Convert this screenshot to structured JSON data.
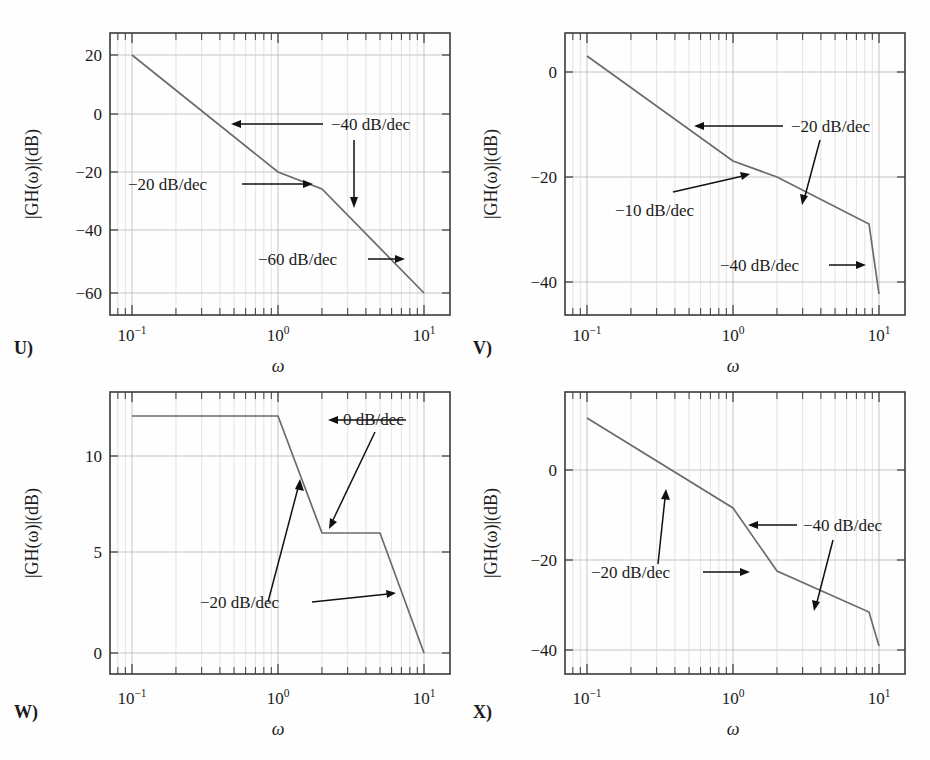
{
  "figure": {
    "curve_color": "#6b6b6b",
    "grid_color": "#b9b9b9",
    "axis_color": "#3a3a3a",
    "text_color": "#1b1b1b"
  },
  "common": {
    "xlabel": "ω",
    "ylabel": "|GH(ω)|(dB)",
    "xticks": [
      "10⁻¹",
      "10⁰",
      "10¹"
    ],
    "xtick_base": "10",
    "xtick_exponents": [
      "−1",
      "0",
      "1"
    ],
    "xtick_values": [
      0.1,
      1,
      10
    ],
    "xlim": [
      0.07,
      13
    ]
  },
  "chart_data": [
    {
      "id": "U",
      "panel_label": "U)",
      "type": "line",
      "title": "",
      "xlabel": "ω",
      "ylabel": "|GH(ω)|(dB)",
      "xscale": "log",
      "xlim": [
        0.07,
        13
      ],
      "ylim": [
        -68,
        28
      ],
      "yticks": [
        20,
        0,
        -20,
        -40,
        -60
      ],
      "ytick_labels": [
        "20",
        "0",
        "−20",
        "−40",
        "−60"
      ],
      "grid": true,
      "legend": "none",
      "points": [
        {
          "x": 0.1,
          "y": 20
        },
        {
          "x": 1.0,
          "y": -20
        },
        {
          "x": 2.0,
          "y": -26
        },
        {
          "x": 5.0,
          "y": -42
        },
        {
          "x": 10.0,
          "y": -60
        }
      ],
      "segments": [
        {
          "from_x": 0.1,
          "to_x": 1.0,
          "slope_db_per_dec": -40
        },
        {
          "from_x": 1.0,
          "to_x": 2.0,
          "slope_db_per_dec": -20
        },
        {
          "from_x": 2.0,
          "to_x": 10.0,
          "slope_db_per_dec": -60
        }
      ],
      "annotations": [
        {
          "label": "−40 dB/dec",
          "kind": "horizontal-left-arrow"
        },
        {
          "label": "−20 dB/dec",
          "kind": "horizontal-right-arrow"
        },
        {
          "label": "−60 dB/dec",
          "kind": "horizontal-right-arrow"
        },
        {
          "label": "−40 dB/dec-downarrow",
          "kind": "vertical-down-arrow"
        }
      ]
    },
    {
      "id": "V",
      "panel_label": "V)",
      "type": "line",
      "title": "",
      "xlabel": "ω",
      "ylabel": "|GH(ω)|(dB)",
      "xscale": "log",
      "xlim": [
        0.07,
        13
      ],
      "ylim": [
        -46,
        8
      ],
      "yticks": [
        0,
        -20,
        -40
      ],
      "ytick_labels": [
        "0",
        "−20",
        "−40"
      ],
      "grid": true,
      "legend": "none",
      "points": [
        {
          "x": 0.1,
          "y": 4
        },
        {
          "x": 1.0,
          "y": -16
        },
        {
          "x": 2.0,
          "y": -19
        },
        {
          "x": 5.0,
          "y": -28
        },
        {
          "x": 10.0,
          "y": -40
        }
      ],
      "segments": [
        {
          "from_x": 0.1,
          "to_x": 1.0,
          "slope_db_per_dec": -20
        },
        {
          "from_x": 1.0,
          "to_x": 2.0,
          "slope_db_per_dec": -10
        },
        {
          "from_x": 2.0,
          "to_x": 5.0,
          "slope_db_per_dec": -20
        },
        {
          "from_x": 5.0,
          "to_x": 10.0,
          "slope_db_per_dec": -40
        }
      ],
      "annotations": [
        {
          "label": "−20 dB/dec",
          "kind": "horizontal-left-arrow"
        },
        {
          "label": "−10 dB/dec",
          "kind": "diagonal-up-right-arrow"
        },
        {
          "label": "−40 dB/dec",
          "kind": "horizontal-right-arrow"
        }
      ]
    },
    {
      "id": "W",
      "panel_label": "W)",
      "type": "line",
      "title": "",
      "xlabel": "ω",
      "ylabel": "|GH(ω)|(dB)",
      "xscale": "log",
      "xlim": [
        0.07,
        13
      ],
      "ylim": [
        -1.6,
        13.2
      ],
      "yticks": [
        10,
        5,
        0
      ],
      "ytick_labels": [
        "10",
        "5",
        "0"
      ],
      "grid": true,
      "legend": "none",
      "points": [
        {
          "x": 0.1,
          "y": 12
        },
        {
          "x": 1.0,
          "y": 12
        },
        {
          "x": 2.0,
          "y": 6
        },
        {
          "x": 5.0,
          "y": 6
        },
        {
          "x": 10.0,
          "y": 0
        }
      ],
      "segments": [
        {
          "from_x": 0.1,
          "to_x": 1.0,
          "slope_db_per_dec": 0
        },
        {
          "from_x": 1.0,
          "to_x": 2.0,
          "slope_db_per_dec": -20
        },
        {
          "from_x": 2.0,
          "to_x": 5.0,
          "slope_db_per_dec": 0
        },
        {
          "from_x": 5.0,
          "to_x": 10.0,
          "slope_db_per_dec": -20
        }
      ],
      "annotations": [
        {
          "label": "0 dB/dec",
          "kind": "horizontal-left-arrow"
        },
        {
          "label": "0 dB/dec-diagonal",
          "kind": "diagonal-down-left-arrow"
        },
        {
          "label": "−20 dB/dec",
          "kind": "diagonal-up-right-arrow"
        },
        {
          "label": "−20 dB/dec-right",
          "kind": "horizontal-right-arrow"
        }
      ]
    },
    {
      "id": "X",
      "panel_label": "X)",
      "type": "line",
      "title": "",
      "xlabel": "ω",
      "ylabel": "|GH(ω)|(dB)",
      "xscale": "log",
      "xlim": [
        0.07,
        13
      ],
      "ylim": [
        -46,
        10
      ],
      "yticks": [
        0,
        -20,
        -40
      ],
      "ytick_labels": [
        "0",
        "−20",
        "−40"
      ],
      "grid": true,
      "legend": "none",
      "points": [
        {
          "x": 0.1,
          "y": 8
        },
        {
          "x": 1.0,
          "y": -8
        },
        {
          "x": 2.0,
          "y": -20
        },
        {
          "x": 5.0,
          "y": -28
        },
        {
          "x": 10.0,
          "y": -40
        }
      ],
      "segments": [
        {
          "from_x": 0.1,
          "to_x": 1.0,
          "slope_db_per_dec": -16
        },
        {
          "from_x": 1.0,
          "to_x": 2.0,
          "slope_db_per_dec": -40
        },
        {
          "from_x": 2.0,
          "to_x": 5.0,
          "slope_db_per_dec": -20
        },
        {
          "from_x": 5.0,
          "to_x": 10.0,
          "slope_db_per_dec": -40
        }
      ],
      "annotations": [
        {
          "label": "−40 dB/dec",
          "kind": "horizontal-left-arrow"
        },
        {
          "label": "−40 dB/dec-downarrow",
          "kind": "diagonal-down-left-arrow"
        },
        {
          "label": "−20 dB/dec",
          "kind": "diagonal-up-left-arrow"
        },
        {
          "label": "−20 dB/dec-right",
          "kind": "horizontal-right-arrow"
        }
      ]
    }
  ],
  "panels": {
    "u": {
      "label": "U)",
      "ylabel": "|GH(ω)|(dB)",
      "xlabel": "ω",
      "yticks": [
        "20",
        "0",
        "−20",
        "−40",
        "−60"
      ],
      "ann1": "−40 dB/dec",
      "ann2": "−20 dB/dec",
      "ann3": "−60 dB/dec"
    },
    "v": {
      "label": "V)",
      "ylabel": "|GH(ω)|(dB)",
      "xlabel": "ω",
      "yticks": [
        "0",
        "−20",
        "−40"
      ],
      "ann1": "−20 dB/dec",
      "ann2": "−10 dB/dec",
      "ann3": "−40 dB/dec"
    },
    "w": {
      "label": "W)",
      "ylabel": "|GH(ω)|(dB)",
      "xlabel": "ω",
      "yticks": [
        "10",
        "5",
        "0"
      ],
      "ann1": "0 dB/dec",
      "ann2": "−20 dB/dec"
    },
    "x": {
      "label": "X)",
      "ylabel": "|GH(ω)|(dB)",
      "xlabel": "ω",
      "yticks": [
        "0",
        "−20",
        "−40"
      ],
      "ann1": "−40 dB/dec",
      "ann2": "−20 dB/dec"
    }
  }
}
